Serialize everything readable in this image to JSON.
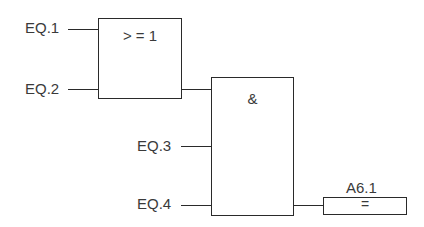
{
  "diagram": {
    "type": "function-block-diagram",
    "inputs": [
      {
        "label": "EQ.1"
      },
      {
        "label": "EQ.2"
      },
      {
        "label": "EQ.3"
      },
      {
        "label": "EQ.4"
      }
    ],
    "blocks": [
      {
        "id": "or",
        "symbol": ">= 1",
        "display": "> = 1"
      },
      {
        "id": "and",
        "symbol": "&",
        "display": "&"
      },
      {
        "id": "assign",
        "symbol": "=",
        "display": "=",
        "output_label": "A6.1"
      }
    ],
    "connections": [
      {
        "from": "EQ.1",
        "to": "or"
      },
      {
        "from": "EQ.2",
        "to": "or"
      },
      {
        "from": "or",
        "to": "and"
      },
      {
        "from": "EQ.3",
        "to": "and"
      },
      {
        "from": "EQ.4",
        "to": "and"
      },
      {
        "from": "and",
        "to": "assign"
      }
    ]
  }
}
